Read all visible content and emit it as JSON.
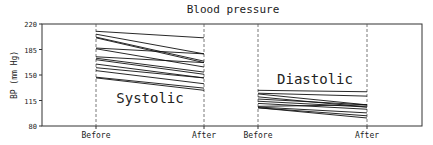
{
  "chart_data": {
    "type": "line",
    "title": "Blood pressure",
    "xlabel": "",
    "ylabel": "BP (mm Hg)",
    "ylim": [
      80,
      220
    ],
    "yticks": [
      80,
      115,
      150,
      185,
      220
    ],
    "grid": false,
    "legend": null,
    "panels": [
      {
        "name": "Systolic",
        "categories": [
          "Before",
          "After"
        ],
        "series": [
          {
            "before": 210,
            "after": 201
          },
          {
            "before": 206,
            "after": 179
          },
          {
            "before": 202,
            "after": 169
          },
          {
            "before": 201,
            "after": 167
          },
          {
            "before": 187,
            "after": 179
          },
          {
            "before": 186,
            "after": 161
          },
          {
            "before": 175,
            "after": 167
          },
          {
            "before": 173,
            "after": 154
          },
          {
            "before": 171,
            "after": 151
          },
          {
            "before": 165,
            "after": 146
          },
          {
            "before": 160,
            "after": 146
          },
          {
            "before": 156,
            "after": 138
          },
          {
            "before": 147,
            "after": 132
          },
          {
            "before": 146,
            "after": 129
          }
        ]
      },
      {
        "name": "Diastolic",
        "categories": [
          "Before",
          "After"
        ],
        "series": [
          {
            "before": 129,
            "after": 127
          },
          {
            "before": 125,
            "after": 121
          },
          {
            "before": 124,
            "after": 109
          },
          {
            "before": 120,
            "after": 106
          },
          {
            "before": 117,
            "after": 109
          },
          {
            "before": 114,
            "after": 106
          },
          {
            "before": 111,
            "after": 103
          },
          {
            "before": 107,
            "after": 109
          },
          {
            "before": 106,
            "after": 98
          },
          {
            "before": 105,
            "after": 94
          },
          {
            "before": 105,
            "after": 91
          }
        ]
      }
    ],
    "annotations": [
      "Systolic",
      "Diastolic"
    ]
  },
  "labels": {
    "title": "Blood pressure",
    "ylabel": "BP (mm Hg)",
    "systolic": "Systolic",
    "diastolic": "Diastolic",
    "before": "Before",
    "after": "After"
  }
}
